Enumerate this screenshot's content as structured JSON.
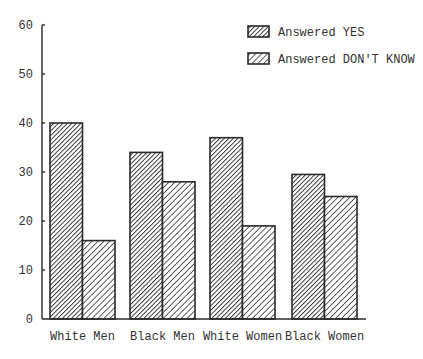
{
  "chart_data": {
    "type": "bar",
    "title": "",
    "xlabel": "",
    "ylabel": "",
    "ylim": [
      0,
      60
    ],
    "yticks": [
      0,
      10,
      20,
      30,
      40,
      50,
      60
    ],
    "grid": false,
    "legend_position": "top-right",
    "categories": [
      "White Men",
      "Black Men",
      "White Women",
      "Black Women"
    ],
    "series": [
      {
        "name": "Answered YES",
        "values": [
          40,
          34,
          37,
          29.5
        ],
        "pattern": "dense-diagonal-hatch"
      },
      {
        "name": "Answered DON'T KNOW",
        "values": [
          16,
          28,
          19,
          25
        ],
        "pattern": "sparse-diagonal-hatch"
      }
    ]
  },
  "colors": {
    "ink": "#2a2a2a",
    "background": "#ffffff"
  }
}
